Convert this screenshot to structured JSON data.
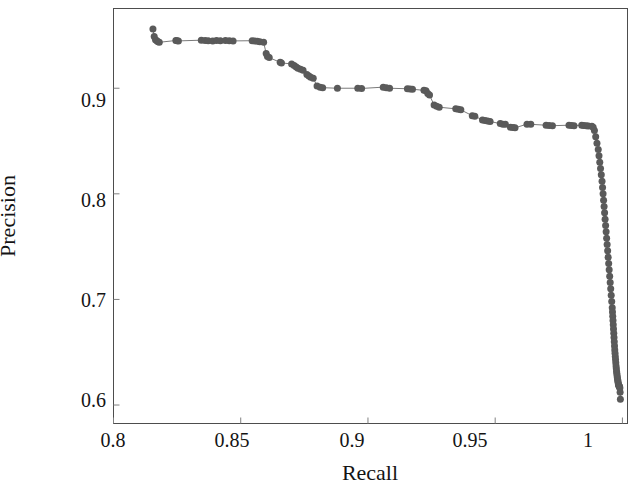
{
  "chart_data": {
    "type": "scatter",
    "title": "",
    "subtitle": "",
    "xlabel": "Recall",
    "ylabel": "Precision",
    "xlim": [
      0.8,
      1.002
    ],
    "ylim": [
      0.5825,
      0.9755
    ],
    "xticks": [
      0.8,
      0.85,
      0.9,
      0.95,
      1
    ],
    "xticklabels": [
      "0.8",
      "0.85",
      "0.9",
      "0.95",
      "1"
    ],
    "yticks": [
      0.6,
      0.7,
      0.8,
      0.9
    ],
    "yticklabels": [
      "0.6",
      "0.7",
      "0.8",
      "0.9"
    ],
    "grid": false,
    "legend": null,
    "annotations": [],
    "series": [
      {
        "name": "precision-recall",
        "marker": "filled-circle",
        "marker_size": 7,
        "color": "#5a5a5a",
        "line_color": "#7a7a7a",
        "line_width": 1,
        "x": [
          0.8155,
          0.816,
          0.8165,
          0.817,
          0.8175,
          0.818,
          0.8245,
          0.825,
          0.8255,
          0.8345,
          0.836,
          0.8372,
          0.839,
          0.8405,
          0.842,
          0.844,
          0.8455,
          0.847,
          0.8545,
          0.8555,
          0.8565,
          0.8575,
          0.859,
          0.86,
          0.8605,
          0.8612,
          0.8655,
          0.866,
          0.87,
          0.871,
          0.8718,
          0.8725,
          0.8735,
          0.8745,
          0.876,
          0.8768,
          0.8775,
          0.8785,
          0.88,
          0.8812,
          0.8822,
          0.888,
          0.896,
          0.8975,
          0.906,
          0.9072,
          0.9085,
          0.9155,
          0.9165,
          0.9175,
          0.922,
          0.9228,
          0.9235,
          0.9242,
          0.926,
          0.927,
          0.928,
          0.9345,
          0.9355,
          0.9365,
          0.941,
          0.942,
          0.945,
          0.946,
          0.947,
          0.948,
          0.952,
          0.953,
          0.954,
          0.956,
          0.957,
          0.9578,
          0.9625,
          0.964,
          0.97,
          0.9712,
          0.9725,
          0.979,
          0.98,
          0.981,
          0.984,
          0.9848,
          0.9858,
          0.9866,
          0.988,
          0.9885,
          0.989,
          0.9895,
          0.99,
          0.9905,
          0.9908,
          0.9911,
          0.9914,
          0.9917,
          0.992,
          0.9922,
          0.9924,
          0.9926,
          0.9928,
          0.993,
          0.9932,
          0.9934,
          0.9936,
          0.9938,
          0.994,
          0.9942,
          0.9944,
          0.9946,
          0.9948,
          0.995,
          0.9952,
          0.9954,
          0.9956,
          0.9958,
          0.996,
          0.9961,
          0.9962,
          0.9963,
          0.9964,
          0.9965,
          0.9966,
          0.9967,
          0.9968,
          0.9969,
          0.997,
          0.9971,
          0.9972,
          0.9973,
          0.9974,
          0.9975,
          0.9976,
          0.9977,
          0.9978,
          0.9979,
          0.998,
          0.9981,
          0.9982,
          0.9983,
          0.9984,
          0.9985,
          0.9986,
          0.9987,
          0.9988,
          0.9989,
          0.999,
          0.9991,
          0.9992
        ],
        "y": [
          0.956,
          0.949,
          0.946,
          0.945,
          0.944,
          0.9435,
          0.9452,
          0.945,
          0.9448,
          0.9455,
          0.9452,
          0.945,
          0.9448,
          0.9452,
          0.945,
          0.9452,
          0.945,
          0.9448,
          0.945,
          0.9448,
          0.9445,
          0.944,
          0.9435,
          0.933,
          0.93,
          0.929,
          0.9245,
          0.924,
          0.923,
          0.9215,
          0.92,
          0.919,
          0.918,
          0.917,
          0.913,
          0.9115,
          0.9105,
          0.9095,
          0.902,
          0.901,
          0.9005,
          0.9,
          0.9,
          0.8998,
          0.901,
          0.9005,
          0.9,
          0.8995,
          0.8992,
          0.899,
          0.898,
          0.8975,
          0.895,
          0.8935,
          0.884,
          0.883,
          0.882,
          0.8805,
          0.88,
          0.8795,
          0.874,
          0.8735,
          0.87,
          0.8695,
          0.869,
          0.8685,
          0.8665,
          0.866,
          0.8658,
          0.863,
          0.8628,
          0.8625,
          0.866,
          0.8658,
          0.865,
          0.8648,
          0.8645,
          0.865,
          0.8648,
          0.8645,
          0.865,
          0.8648,
          0.8645,
          0.8642,
          0.864,
          0.863,
          0.86,
          0.854,
          0.848,
          0.842,
          0.836,
          0.83,
          0.824,
          0.818,
          0.812,
          0.806,
          0.8,
          0.794,
          0.788,
          0.782,
          0.776,
          0.77,
          0.764,
          0.758,
          0.752,
          0.746,
          0.74,
          0.734,
          0.728,
          0.722,
          0.716,
          0.71,
          0.704,
          0.698,
          0.692,
          0.688,
          0.684,
          0.68,
          0.676,
          0.672,
          0.668,
          0.664,
          0.66,
          0.656,
          0.652,
          0.649,
          0.646,
          0.643,
          0.64,
          0.637,
          0.6345,
          0.632,
          0.63,
          0.628,
          0.626,
          0.6245,
          0.623,
          0.6215,
          0.62,
          0.619,
          0.6185,
          0.618,
          0.6175,
          0.617,
          0.616,
          0.612,
          0.6055
        ]
      }
    ]
  },
  "axes": {
    "frame_color": "#4d4d4d",
    "tick_color": "#808080"
  }
}
